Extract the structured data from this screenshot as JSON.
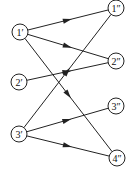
{
  "diagram": {
    "type": "bipartite-directed-graph",
    "colors": {
      "stroke": "#222222",
      "background": "#ffffff"
    },
    "nodes": [
      {
        "id": "1p",
        "label": "1′",
        "x": 20,
        "y": 32,
        "r": 8
      },
      {
        "id": "2p",
        "label": "2′",
        "x": 19,
        "y": 82,
        "r": 8
      },
      {
        "id": "3p",
        "label": "3′",
        "x": 19,
        "y": 134,
        "r": 8
      },
      {
        "id": "1pp",
        "label": "1″",
        "x": 116,
        "y": 8,
        "r": 8
      },
      {
        "id": "2pp",
        "label": "2″",
        "x": 116,
        "y": 61,
        "r": 8
      },
      {
        "id": "3pp",
        "label": "3″",
        "x": 116,
        "y": 106,
        "r": 8
      },
      {
        "id": "4pp",
        "label": "4″",
        "x": 117,
        "y": 158,
        "r": 8
      }
    ],
    "edges": [
      {
        "from": "1p",
        "to": "1pp"
      },
      {
        "from": "1p",
        "to": "2pp"
      },
      {
        "from": "1p",
        "to": "4pp"
      },
      {
        "from": "2p",
        "to": "2pp"
      },
      {
        "from": "3p",
        "to": "1pp"
      },
      {
        "from": "3p",
        "to": "3pp"
      },
      {
        "from": "3p",
        "to": "4pp"
      }
    ]
  }
}
